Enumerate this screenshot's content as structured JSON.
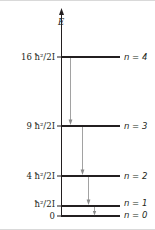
{
  "diagram": {
    "type": "energy-level-diagram",
    "axis_label": "E",
    "levels": [
      {
        "n_label": "n = 4",
        "energy_label": "16 ħ²/2I",
        "y": 57
      },
      {
        "n_label": "n = 3",
        "energy_label": "9 ħ²/2I",
        "y": 126
      },
      {
        "n_label": "n = 2",
        "energy_label": "4 ħ²/2I",
        "y": 176
      },
      {
        "n_label": "n = 1",
        "energy_label": "ħ²/2I",
        "y": 206
      },
      {
        "n_label": "n = 0",
        "energy_label": "0",
        "y": 216
      }
    ],
    "transitions": [
      {
        "from": "n = 4",
        "to": "n = 3"
      },
      {
        "from": "n = 3",
        "to": "n = 2"
      },
      {
        "from": "n = 2",
        "to": "n = 1"
      },
      {
        "from": "n = 1",
        "to": "n = 0"
      }
    ],
    "colors": {
      "ink": "#231f20",
      "arrow": "#8a8a8a",
      "frame": "#d0d0d0"
    }
  }
}
